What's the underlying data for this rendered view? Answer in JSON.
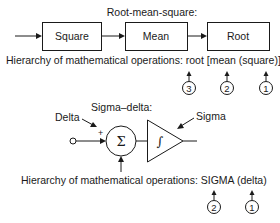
{
  "rms": {
    "title": "Root-mean-square:",
    "blocks": [
      "Square",
      "Mean",
      "Root"
    ],
    "hierarchy_label": "Hierarchy of mathematical operations: root [mean (square)]",
    "order_markers": [
      "3",
      "2",
      "1"
    ]
  },
  "sigma_delta": {
    "title": "Sigma–delta:",
    "input_label": "Delta",
    "plus_sign": "+",
    "summer_symbol": "Σ",
    "integrator_symbol": "∫",
    "output_label": "Sigma",
    "hierarchy_label": "Hierarchy of mathematical operations: SIGMA (delta)",
    "order_markers": [
      "2",
      "1"
    ]
  }
}
